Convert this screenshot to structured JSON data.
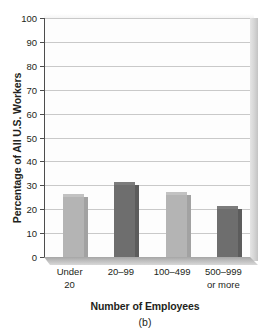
{
  "figure": {
    "caption": "(b)"
  },
  "chart_data": {
    "type": "bar",
    "title": "",
    "subtitle": "",
    "xlabel": "Number of Employees",
    "ylabel": "Percentage of All U.S. Workers",
    "categories": [
      "Under 20",
      "20–99",
      "100–499",
      "500–999 or more"
    ],
    "category_lines": [
      [
        "Under",
        "20"
      ],
      [
        "20–99",
        ""
      ],
      [
        "100–499",
        ""
      ],
      [
        "500–999",
        "or more"
      ]
    ],
    "values": [
      25,
      30,
      26,
      20
    ],
    "bar_colors": [
      "#b4b4b4",
      "#6e6e6e",
      "#b4b4b4",
      "#6e6e6e"
    ],
    "ylim": [
      0,
      100
    ],
    "ytick_step": 10,
    "ytick_labels": [
      "0",
      "10",
      "20",
      "30",
      "40",
      "50",
      "60",
      "70",
      "80",
      "90",
      "100"
    ],
    "grid": true,
    "legend": "none",
    "style": "3d-bar",
    "units": "percent"
  },
  "colors": {
    "bar_light": "#b4b4b4",
    "bar_dark": "#6e6e6e",
    "gridline": "#c9c9c9",
    "axis": "#4d4d4d",
    "text": "#231f20",
    "plot_background": "#fdfdfd",
    "floor": "#bdbdbd",
    "depth_panel": "#d6d6d6"
  }
}
